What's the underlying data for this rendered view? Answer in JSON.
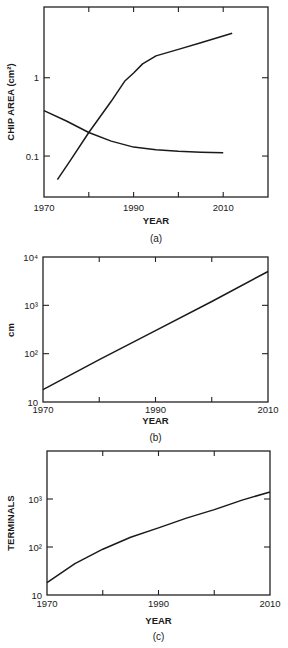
{
  "figure": {
    "panels": [
      {
        "caption": "(a)",
        "xlabel": "YEAR",
        "ylabel": "CHIP AREA (cm²)"
      },
      {
        "caption": "(b)",
        "xlabel": "YEAR",
        "ylabel": "cm"
      },
      {
        "caption": "(c)",
        "xlabel": "YEAR",
        "ylabel": "TERMINALS"
      }
    ]
  },
  "chart_data": [
    {
      "type": "line",
      "title": "",
      "caption": "(a)",
      "xlabel": "YEAR",
      "ylabel": "CHIP AREA (cm²)",
      "yscale": "log",
      "xlim": [
        1970,
        2020
      ],
      "ylim": [
        0.03,
        8
      ],
      "x_ticks": [
        1970,
        1980,
        1990,
        2000,
        2010
      ],
      "x_tick_labels": [
        "1970",
        "1990",
        "2010"
      ],
      "y_ticks": [
        0.1,
        1
      ],
      "y_tick_labels": [
        "0.1",
        "1"
      ],
      "grid": false,
      "series": [
        {
          "name": "rising curve",
          "x": [
            1973,
            1976,
            1980,
            1985,
            1988,
            1990,
            1992,
            1995,
            2000,
            2005,
            2012
          ],
          "y": [
            0.05,
            0.09,
            0.2,
            0.5,
            0.9,
            1.15,
            1.5,
            1.9,
            2.3,
            2.8,
            3.7
          ]
        },
        {
          "name": "falling curve",
          "x": [
            1970,
            1975,
            1980,
            1985,
            1990,
            1995,
            2000,
            2005,
            2010
          ],
          "y": [
            0.38,
            0.28,
            0.2,
            0.155,
            0.13,
            0.12,
            0.115,
            0.112,
            0.11
          ]
        }
      ]
    },
    {
      "type": "line",
      "title": "",
      "caption": "(b)",
      "xlabel": "YEAR",
      "ylabel": "cm",
      "yscale": "log",
      "xlim": [
        1970,
        2010
      ],
      "ylim": [
        10,
        10000
      ],
      "x_ticks": [
        1970,
        1980,
        1990,
        2000,
        2010
      ],
      "x_tick_labels": [
        "1970",
        "1990",
        "2010"
      ],
      "y_ticks": [
        10,
        100,
        1000,
        10000
      ],
      "y_tick_labels": [
        "10",
        "10²",
        "10³",
        "10⁴"
      ],
      "grid": false,
      "series": [
        {
          "name": "line",
          "x": [
            1970,
            1980,
            1990,
            2000,
            2010
          ],
          "y": [
            18,
            75,
            300,
            1200,
            5000
          ]
        }
      ]
    },
    {
      "type": "line",
      "title": "",
      "caption": "(c)",
      "xlabel": "YEAR",
      "ylabel": "TERMINALS",
      "yscale": "log",
      "xlim": [
        1970,
        2010
      ],
      "ylim": [
        10,
        10000
      ],
      "x_ticks": [
        1970,
        1980,
        1990,
        2000,
        2010
      ],
      "x_tick_labels": [
        "1970",
        "1990",
        "2010"
      ],
      "y_ticks": [
        10,
        100,
        1000
      ],
      "y_tick_labels": [
        "10",
        "10²",
        "10³"
      ],
      "grid": false,
      "series": [
        {
          "name": "curve",
          "x": [
            1970,
            1975,
            1980,
            1985,
            1990,
            1995,
            2000,
            2005,
            2010
          ],
          "y": [
            18,
            45,
            90,
            160,
            250,
            400,
            600,
            950,
            1400
          ]
        }
      ]
    }
  ]
}
